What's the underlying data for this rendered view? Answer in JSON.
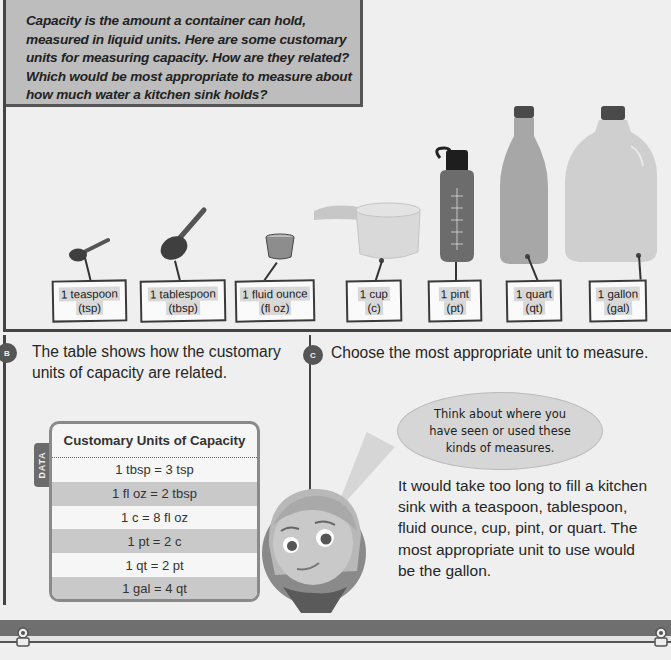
{
  "panel_a": {
    "intro": "Capacity is the amount a container can hold, measured in liquid units. Here are some customary units for measuring capacity. How are they related? Which would be most appropriate to measure about how much water a kitchen sink holds?",
    "items": [
      {
        "name": "1 teaspoon",
        "abbr": "(tsp)",
        "icon": "teaspoon-icon"
      },
      {
        "name": "1 tablespoon",
        "abbr": "(tbsp)",
        "icon": "tablespoon-icon"
      },
      {
        "name": "1 fluid ounce",
        "abbr": "(fl oz)",
        "icon": "fluid-ounce-cup-icon"
      },
      {
        "name": "1 cup",
        "abbr": "(c)",
        "icon": "measuring-cup-icon"
      },
      {
        "name": "1 pint",
        "abbr": "(pt)",
        "icon": "water-bottle-icon"
      },
      {
        "name": "1 quart",
        "abbr": "(qt)",
        "icon": "quart-bottle-icon"
      },
      {
        "name": "1 gallon",
        "abbr": "(gal)",
        "icon": "gallon-jug-icon"
      }
    ]
  },
  "panel_b": {
    "badge": "B",
    "text": "The table shows how the customary units of capacity are related.",
    "data_tab": "DATA",
    "table": {
      "title": "Customary Units of Capacity",
      "rows": [
        "1 tbsp = 3 tsp",
        "1 fl oz = 2 tbsp",
        "1 c = 8 fl oz",
        "1 pt = 2 c",
        "1 qt = 2 pt",
        "1 gal = 4 qt"
      ]
    }
  },
  "panel_c": {
    "badge": "C",
    "text": "Choose the most appropriate unit to measure.",
    "bubble": "Think about where you have seen or used these kinds of measures.",
    "answer": "It would take too long to fill a kitchen sink with a teaspoon, tablespoon, fluid ounce, cup, pint, or quart. The most appropriate unit to use would be the gallon."
  },
  "colors": {
    "panel_border": "#444444",
    "intro_bg": "#bdbdbd",
    "table_shade": "#c9c9c9",
    "badge_bg": "#555555",
    "bubble_bg": "#d6d6d6",
    "band_dark": "#6f6f6f"
  }
}
